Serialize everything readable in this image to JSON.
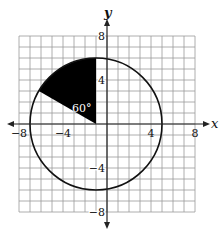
{
  "diagram": {
    "type": "coordinate-plane-circle-sector",
    "axes": {
      "x_label": "x",
      "y_label": "y",
      "x_ticks": [
        {
          "value": -8,
          "label": "−8"
        },
        {
          "value": -4,
          "label": "−4"
        },
        {
          "value": 4,
          "label": "4"
        },
        {
          "value": 8,
          "label": "8"
        }
      ],
      "y_ticks": [
        {
          "value": 8,
          "label": "8"
        },
        {
          "value": 4,
          "label": "4"
        },
        {
          "value": -4,
          "label": "−4"
        },
        {
          "value": -8,
          "label": "−8"
        }
      ],
      "range": [
        -8,
        8
      ],
      "grid_step": 1
    },
    "circle": {
      "center": [
        -1,
        0
      ],
      "radius": 6
    },
    "sector": {
      "start_angle_deg": 90,
      "end_angle_deg": 150,
      "fill": "#000000",
      "angle_label": "60°"
    },
    "colors": {
      "grid": "#9a9a9a",
      "axis": "#222222",
      "circle": "#111111",
      "sector_fill": "#000000",
      "angle_label": "#ffffff",
      "background": "#ffffff"
    }
  }
}
